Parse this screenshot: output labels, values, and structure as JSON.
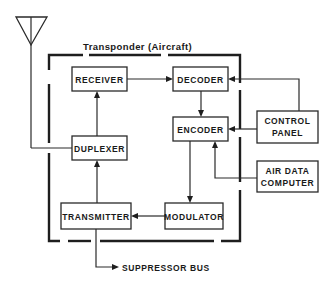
{
  "diagram": {
    "enclosure_label": "Transponder (Aircraft)",
    "blocks": {
      "receiver": "RECEIVER",
      "decoder": "DECODER",
      "encoder": "ENCODER",
      "duplexer": "DUPLEXER",
      "transmitter": "TRANSMITTER",
      "modulator": "MODULATOR",
      "control_panel": [
        "CONTROL",
        "PANEL"
      ],
      "air_data_computer": [
        "AIR DATA",
        "COMPUTER"
      ]
    },
    "outputs": {
      "suppressor_bus": "SUPPRESSOR BUS"
    },
    "external": {
      "antenna": "antenna"
    },
    "connections": [
      {
        "from": "antenna",
        "to": "duplexer"
      },
      {
        "from": "duplexer",
        "to": "receiver"
      },
      {
        "from": "receiver",
        "to": "decoder"
      },
      {
        "from": "decoder",
        "to": "encoder"
      },
      {
        "from": "control_panel",
        "to": "decoder"
      },
      {
        "from": "control_panel",
        "to": "encoder"
      },
      {
        "from": "air_data_computer",
        "to": "encoder"
      },
      {
        "from": "encoder",
        "to": "modulator"
      },
      {
        "from": "modulator",
        "to": "transmitter"
      },
      {
        "from": "transmitter",
        "to": "duplexer"
      },
      {
        "from": "transmitter",
        "to": "suppressor_bus"
      }
    ],
    "colors": {
      "line": "#1e1e1e",
      "background": "#ffffff"
    }
  }
}
